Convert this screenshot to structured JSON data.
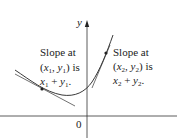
{
  "figure": {
    "axes": {
      "x_origin_label": "0",
      "y_axis_label": "y"
    },
    "left_annotation": {
      "line1": "Slope at",
      "point": {
        "x": "x",
        "x_sub": "1",
        "y": "y",
        "y_sub": "1"
      },
      "line2_suffix": "is",
      "expr": {
        "a": "x",
        "a_sub": "1",
        "op": "+",
        "b": "y",
        "b_sub": "1",
        "end": "."
      }
    },
    "right_annotation": {
      "line1": "Slope at",
      "point": {
        "x": "x",
        "x_sub": "2",
        "y": "y",
        "y_sub": "2"
      },
      "line2_suffix": "is",
      "expr": {
        "a": "x",
        "a_sub": "2",
        "op": "+",
        "b": "y",
        "b_sub": "2",
        "end": "."
      }
    },
    "colors": {
      "ink": "#222222",
      "background": "#ffffff"
    }
  }
}
